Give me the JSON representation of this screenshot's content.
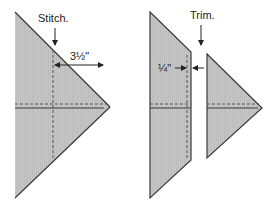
{
  "diagram": {
    "left": {
      "step_label": "Stitch.",
      "dimension_label": "3½\""
    },
    "right": {
      "step_label": "Trim.",
      "dimension_label": "¼\""
    },
    "colors": {
      "fabric_fill": "#c4c4c4",
      "outline": "#3a3a3a",
      "stitch_line": "#555555",
      "background": "#ffffff"
    }
  }
}
